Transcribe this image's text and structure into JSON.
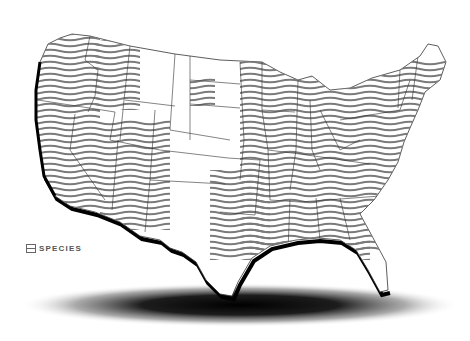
{
  "map": {
    "type": "choropleth-hatch",
    "region": "Contiguous United States",
    "colors": {
      "background": "#ffffff",
      "state_fill": "#ffffff",
      "state_border": "#333333",
      "hatch": "#7a7a7a",
      "coast_shadow": "#000000"
    },
    "hatched_regions": [
      "Pacific Northwest & West Coast",
      "Northern Rockies",
      "Utah / Arizona corridor",
      "South Dakota (partial)",
      "Midwest",
      "Great Lakes",
      "Northeast",
      "Southeast",
      "East Texas / Oklahoma"
    ]
  },
  "legend": {
    "icon": "hatch-swatch-icon",
    "label": "SPECIES"
  }
}
